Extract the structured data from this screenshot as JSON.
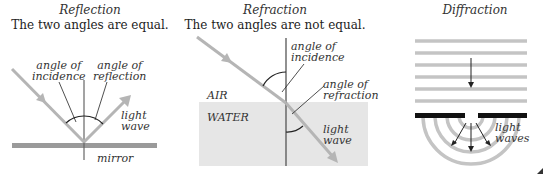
{
  "reflection": {
    "title": "Reflection",
    "subtitle": "The two angles are equal.",
    "label_incidence": [
      "angle of",
      "incidence"
    ],
    "label_reflection": [
      "angle of",
      "reflection"
    ],
    "label_wave": [
      "light",
      "wave"
    ],
    "label_mirror": "mirror"
  },
  "refraction": {
    "title": "Refraction",
    "subtitle": "The two angles are not equal.",
    "label_incidence": [
      "angle of",
      "incidence"
    ],
    "label_refraction": [
      "angle of",
      "refraction"
    ],
    "label_air": "AIR",
    "label_water": "WATER",
    "label_wave": [
      "light",
      "wave"
    ]
  },
  "diffraction": {
    "title": "Diffraction",
    "label_waves": [
      "light",
      "waves"
    ]
  },
  "colors": {
    "ray": "#b5b5b5",
    "mirror": "#9a9a9a",
    "water": "#e6e6e6",
    "line": "#555555",
    "barrier": "#111111",
    "wavefront": "#c4c4c4"
  }
}
